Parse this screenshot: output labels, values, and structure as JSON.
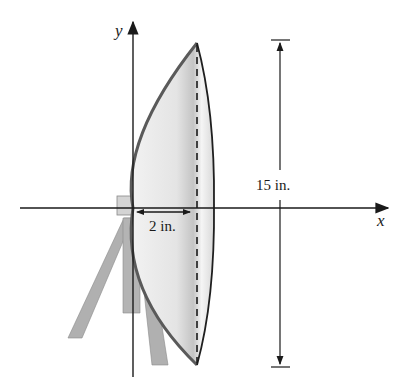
{
  "diagram": {
    "axes": {
      "x_label": "x",
      "y_label": "y"
    },
    "dimensions": {
      "depth_label": "2 in.",
      "diameter_label": "15 in."
    },
    "colors": {
      "line": "#1a1a1a",
      "dish_outline": "#555555",
      "dish_fill_light": "#ececec",
      "dish_fill_dark": "#bdbdbd",
      "stand": "#a8a8a8",
      "background": "#ffffff"
    }
  }
}
